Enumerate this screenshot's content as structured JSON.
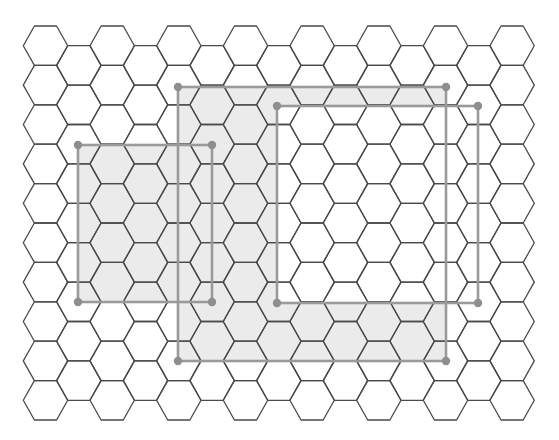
{
  "figure": {
    "width": 559,
    "height": 440,
    "colors": {
      "background": "#ffffff",
      "hex_stroke": "#4a4a4a",
      "shade_fill": "#ebebeb",
      "rect_stroke": "#9a9a9a",
      "corner_dot": "#8e8e8e"
    },
    "hex_grid": {
      "orientation": "flat-top",
      "half_width": 22.2,
      "half_height": 19.7,
      "x0": 45.5,
      "col_step": 33.33,
      "row_step": 39.4,
      "columns": 15,
      "even_column_rows": 10,
      "odd_column_rows": 9,
      "even_y0": 45.7,
      "odd_y0": 65.4
    },
    "rectangles": [
      {
        "id": "A",
        "x1": 78,
        "y1": 145,
        "x2": 212,
        "y2": 302,
        "shaded": true
      },
      {
        "id": "B",
        "x1": 178,
        "y1": 87,
        "x2": 446,
        "y2": 361,
        "shaded": true
      },
      {
        "id": "C",
        "x1": 277,
        "y1": 106,
        "x2": 478,
        "y2": 303,
        "shaded": false
      }
    ],
    "shading_rule": "A ∪ (B − C)"
  }
}
